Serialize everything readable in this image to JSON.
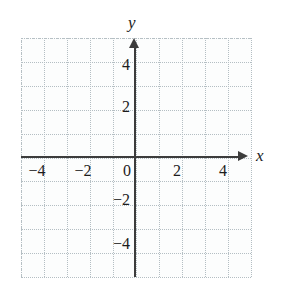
{
  "figure": {
    "kind": "cartesian-coordinate-plane",
    "background_color": "#ffffff",
    "plot_background_color": "#fcfdfd",
    "grid_color": "#b4bec3",
    "axis_color": "#3c3c3c",
    "text_color": "#1c1c1c"
  },
  "chart_data": {
    "type": "scatter",
    "title": "",
    "subtitle": "",
    "xlabel": "x",
    "ylabel": "y",
    "xlim": [
      -5,
      5
    ],
    "ylim": [
      -5,
      5
    ],
    "xticks": [
      -4,
      -2,
      0,
      2,
      4
    ],
    "yticks": [
      4,
      2,
      -2,
      -4
    ],
    "xtick_labels": [
      "−4",
      "−2",
      "0",
      "2",
      "4"
    ],
    "ytick_labels": [
      "4",
      "2",
      "−2",
      "−4"
    ],
    "grid": true,
    "grid_style": "dotted",
    "grid_step": 1,
    "legend": null,
    "series": [],
    "x": [],
    "values": [],
    "annotations": []
  },
  "axis_labels": {
    "y": "y",
    "x": "x"
  },
  "x_ticks": [
    {
      "value": -4,
      "label": "−4",
      "px_left": 22
    },
    {
      "value": -2,
      "label": "−2",
      "px_left": 68
    },
    {
      "value": 0,
      "label": "0",
      "px_left": 112
    },
    {
      "value": 2,
      "label": "2",
      "px_left": 162
    },
    {
      "value": 4,
      "label": "4",
      "px_left": 208
    }
  ],
  "y_ticks": [
    {
      "value": 4,
      "label": "4",
      "px_top": 57
    },
    {
      "value": 2,
      "label": "2",
      "px_top": 99
    },
    {
      "value": -2,
      "label": "−2",
      "px_top": 192
    },
    {
      "value": -4,
      "label": "−4",
      "px_top": 236
    }
  ],
  "gridlines": {
    "vertical_px": [
      21,
      44,
      67,
      90,
      113,
      136,
      159,
      182,
      205,
      228,
      251
    ],
    "horizontal_px": [
      38,
      62,
      86,
      110,
      134,
      158,
      181,
      205,
      229,
      253,
      277
    ]
  }
}
